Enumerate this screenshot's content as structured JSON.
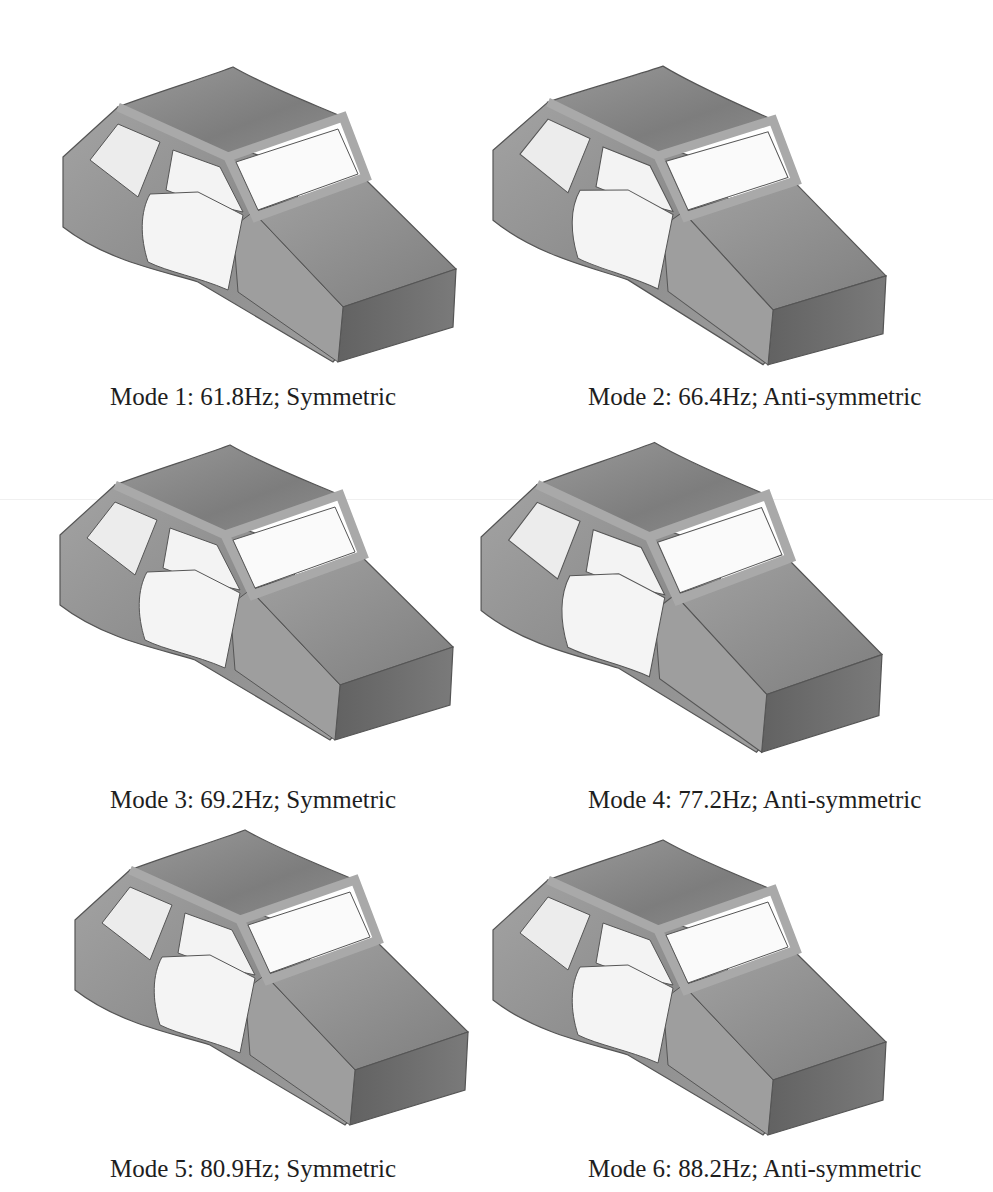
{
  "figure": {
    "panels": [
      {
        "mode": 1,
        "frequency": "61.8Hz",
        "type": "Symmetric",
        "caption": "Mode 1: 61.8Hz; Symmetric"
      },
      {
        "mode": 2,
        "frequency": "66.4Hz",
        "type": "Anti-symmetric",
        "caption": "Mode 2: 66.4Hz; Anti-symmetric"
      },
      {
        "mode": 3,
        "frequency": "69.2Hz",
        "type": "Symmetric",
        "caption": "Mode 3: 69.2Hz; Symmetric"
      },
      {
        "mode": 4,
        "frequency": "77.2Hz",
        "type": "Anti-symmetric",
        "caption": "Mode 4: 77.2Hz; Anti-symmetric"
      },
      {
        "mode": 5,
        "frequency": "80.9Hz",
        "type": "Symmetric",
        "caption": "Mode 5: 80.9Hz; Symmetric"
      },
      {
        "mode": 6,
        "frequency": "88.2Hz",
        "type": "Anti-symmetric",
        "caption": "Mode 6: 88.2Hz; Anti-symmetric"
      }
    ],
    "colors": {
      "roof": "#8a8a8a",
      "side": "#9a9a9a",
      "hood": "#8e8e8e",
      "front": "#6e6e6e",
      "window": "#f2f2f2",
      "pillar": "#a8a8a8",
      "outline": "#555555"
    }
  }
}
